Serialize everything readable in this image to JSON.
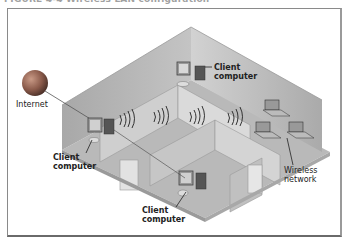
{
  "caption": "FIGURE 4-4  Wireless LAN configuration",
  "labels": {
    "internet": "Internet",
    "client_top_line1": "Client",
    "client_top_line2": "computer",
    "client_left_line1": "Client",
    "client_left_line2": "computer",
    "client_bottom_line1": "Client",
    "client_bottom_line2": "computer",
    "wireless_line1": "Wireless",
    "wireless_line2": "network"
  },
  "colors": {
    "wall_light": "#c8c8c8",
    "wall_dark": "#9e9e9e",
    "floor": "#b4b4b4",
    "globe": "#8a5a4a",
    "frame": "#8a8a8a"
  }
}
